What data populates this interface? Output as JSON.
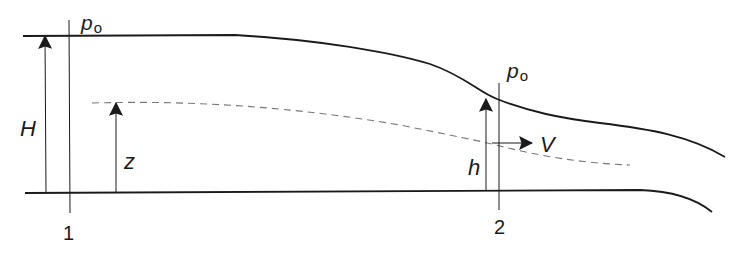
{
  "diagram": {
    "colors": {
      "line": "#1a1a1a",
      "dashed": "#777777",
      "background": "#ffffff"
    },
    "labels": {
      "pressure_1": "p",
      "pressure_1_sub": "o",
      "pressure_2": "p",
      "pressure_2_sub": "o",
      "total_head": "H",
      "streamline_height": "z",
      "depth_2": "h",
      "velocity": "V",
      "station_1": "1",
      "station_2": "2"
    },
    "elements": [
      "free-surface",
      "channel-bottom",
      "streamline-dashed",
      "station-1-line",
      "station-2-line",
      "H-arrow",
      "z-arrow",
      "h-arrow",
      "V-arrow"
    ]
  }
}
